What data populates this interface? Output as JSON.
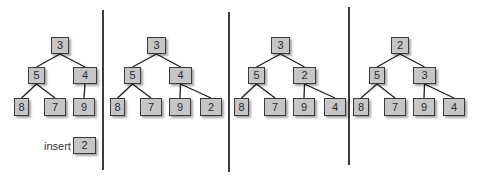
{
  "diagram": {
    "dividers": [
      {
        "x": 103,
        "y1": 10,
        "y2": 170
      },
      {
        "x": 229,
        "y1": 12,
        "y2": 172
      },
      {
        "x": 349,
        "y1": 7,
        "y2": 165
      }
    ],
    "insert": {
      "label": "insert",
      "value": "2",
      "label_pos": {
        "x": 44,
        "y": 139
      },
      "box": {
        "x": 73,
        "y": 137,
        "w": 23,
        "h": 17
      }
    },
    "panels": [
      {
        "step": 1,
        "nodes": [
          {
            "id": "r",
            "value": "3",
            "x": 51,
            "y": 37,
            "w": 18,
            "h": 17
          },
          {
            "id": "l",
            "value": "5",
            "x": 28,
            "y": 67,
            "w": 17,
            "h": 17
          },
          {
            "id": "rt",
            "value": "4",
            "x": 73,
            "y": 67,
            "w": 24,
            "h": 17
          },
          {
            "id": "ll",
            "value": "8",
            "x": 14,
            "y": 98,
            "w": 15,
            "h": 18
          },
          {
            "id": "lr",
            "value": "7",
            "x": 44,
            "y": 98,
            "w": 22,
            "h": 18
          },
          {
            "id": "rl",
            "value": "9",
            "x": 73,
            "y": 98,
            "w": 22,
            "h": 18
          }
        ],
        "edges": [
          [
            "r",
            "l"
          ],
          [
            "r",
            "rt"
          ],
          [
            "l",
            "ll"
          ],
          [
            "l",
            "lr"
          ],
          [
            "rt",
            "rl"
          ]
        ]
      },
      {
        "step": 2,
        "nodes": [
          {
            "id": "r",
            "value": "3",
            "x": 147,
            "y": 37,
            "w": 19,
            "h": 17
          },
          {
            "id": "l",
            "value": "5",
            "x": 124,
            "y": 67,
            "w": 17,
            "h": 17
          },
          {
            "id": "rt",
            "value": "4",
            "x": 169,
            "y": 67,
            "w": 23,
            "h": 17
          },
          {
            "id": "ll",
            "value": "8",
            "x": 110,
            "y": 98,
            "w": 15,
            "h": 18
          },
          {
            "id": "lr",
            "value": "7",
            "x": 140,
            "y": 98,
            "w": 22,
            "h": 18
          },
          {
            "id": "rl",
            "value": "9",
            "x": 169,
            "y": 98,
            "w": 22,
            "h": 18
          },
          {
            "id": "rr",
            "value": "2",
            "x": 200,
            "y": 98,
            "w": 22,
            "h": 18
          }
        ],
        "edges": [
          [
            "r",
            "l"
          ],
          [
            "r",
            "rt"
          ],
          [
            "l",
            "ll"
          ],
          [
            "l",
            "lr"
          ],
          [
            "rt",
            "rl"
          ],
          [
            "rt",
            "rr"
          ]
        ]
      },
      {
        "step": 3,
        "nodes": [
          {
            "id": "r",
            "value": "3",
            "x": 271,
            "y": 37,
            "w": 19,
            "h": 17
          },
          {
            "id": "l",
            "value": "5",
            "x": 248,
            "y": 67,
            "w": 17,
            "h": 17
          },
          {
            "id": "rt",
            "value": "2",
            "x": 293,
            "y": 67,
            "w": 23,
            "h": 17
          },
          {
            "id": "ll",
            "value": "8",
            "x": 234,
            "y": 98,
            "w": 15,
            "h": 18
          },
          {
            "id": "lr",
            "value": "7",
            "x": 264,
            "y": 98,
            "w": 22,
            "h": 18
          },
          {
            "id": "rl",
            "value": "9",
            "x": 293,
            "y": 98,
            "w": 22,
            "h": 18
          },
          {
            "id": "rr",
            "value": "4",
            "x": 324,
            "y": 98,
            "w": 22,
            "h": 18
          }
        ],
        "edges": [
          [
            "r",
            "l"
          ],
          [
            "r",
            "rt"
          ],
          [
            "l",
            "ll"
          ],
          [
            "l",
            "lr"
          ],
          [
            "rt",
            "rl"
          ],
          [
            "rt",
            "rr"
          ]
        ]
      },
      {
        "step": 4,
        "nodes": [
          {
            "id": "r",
            "value": "2",
            "x": 391,
            "y": 37,
            "w": 18,
            "h": 17
          },
          {
            "id": "l",
            "value": "5",
            "x": 369,
            "y": 67,
            "w": 16,
            "h": 17
          },
          {
            "id": "rt",
            "value": "3",
            "x": 413,
            "y": 67,
            "w": 23,
            "h": 17
          },
          {
            "id": "ll",
            "value": "8",
            "x": 353,
            "y": 98,
            "w": 16,
            "h": 18
          },
          {
            "id": "lr",
            "value": "7",
            "x": 384,
            "y": 98,
            "w": 22,
            "h": 18
          },
          {
            "id": "rl",
            "value": "9",
            "x": 413,
            "y": 98,
            "w": 22,
            "h": 18
          },
          {
            "id": "rr",
            "value": "4",
            "x": 443,
            "y": 98,
            "w": 22,
            "h": 18
          }
        ],
        "edges": [
          [
            "r",
            "l"
          ],
          [
            "r",
            "rt"
          ],
          [
            "l",
            "ll"
          ],
          [
            "l",
            "lr"
          ],
          [
            "rt",
            "rl"
          ],
          [
            "rt",
            "rr"
          ]
        ]
      }
    ]
  }
}
